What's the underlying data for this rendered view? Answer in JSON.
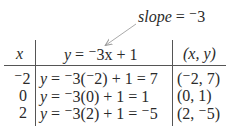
{
  "annotation": {
    "label_var": "slope",
    "label_rest": " = ⁻3"
  },
  "table": {
    "headers": {
      "x": "x",
      "equation_y": "y",
      "equation_rest": " = ⁻3x + 1",
      "pair": "(x, y)"
    },
    "rows": [
      {
        "x": "⁻2",
        "y": "y",
        "calc": " = ⁻3(⁻2) + 1 = 7",
        "pair": "(⁻2, 7)"
      },
      {
        "x": "0",
        "y": "y",
        "calc": " = ⁻3(0) + 1 = 1",
        "pair": "(0, 1)"
      },
      {
        "x": "2",
        "y": "y",
        "calc": " = ⁻3(2) + 1 = ⁻5",
        "pair": "(2, ⁻5)"
      }
    ]
  }
}
